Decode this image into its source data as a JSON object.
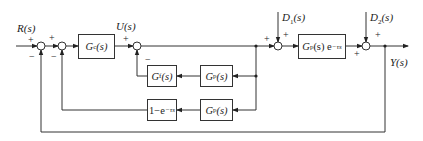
{
  "diagram": {
    "signals": {
      "reference": "R(s)",
      "control": "U(s)",
      "disturbance1": "D1(s)",
      "disturbance2": "D2(s)",
      "output": "Y(s)"
    },
    "blocks": {
      "controller": {
        "main": "G",
        "sub": "c",
        "tail": "(s)"
      },
      "plant": {
        "main": "G",
        "sub": "p",
        "tail": "(s) e",
        "sup": "−τs"
      },
      "filter": {
        "main": "G",
        "sub": "f",
        "tail": "(s)"
      },
      "model_upper": {
        "main": "G",
        "sub": "p",
        "tail": "(s)"
      },
      "model_lower": {
        "main": "G",
        "sub": "p",
        "tail": "(s)"
      },
      "delay_comp": {
        "main": "1−e",
        "sup": "−τs"
      }
    },
    "signs": {
      "sum1_in": "+",
      "sum1_fb": "−",
      "sum2_in": "+",
      "sum2_fb": "−",
      "sum3_in": "+",
      "sum3_fb": "−",
      "sum4_in": "+",
      "sum4_d": "+",
      "sum5_in": "+",
      "sum5_d": "+"
    },
    "colors": {
      "line": "#333333",
      "background": "#ffffff"
    }
  }
}
